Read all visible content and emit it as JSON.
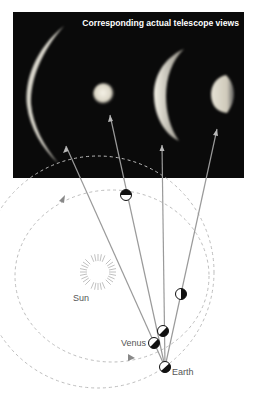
{
  "panel": {
    "title": "Corresponding actual telescope views",
    "background": "#0a0a0a",
    "views": [
      {
        "name": "thin-crescent",
        "phase": "thin crescent"
      },
      {
        "name": "full",
        "phase": "nearly full"
      },
      {
        "name": "thick-crescent",
        "phase": "crescent"
      },
      {
        "name": "gibbous",
        "phase": "gibbous"
      }
    ]
  },
  "diagram": {
    "labels": {
      "sun": "Sun",
      "venus": "Venus",
      "earth": "Earth"
    },
    "colors": {
      "sight_line": "#9a9a9a",
      "orbit": "#bdbdbd",
      "sun_rays": "#b0b0b0"
    }
  }
}
